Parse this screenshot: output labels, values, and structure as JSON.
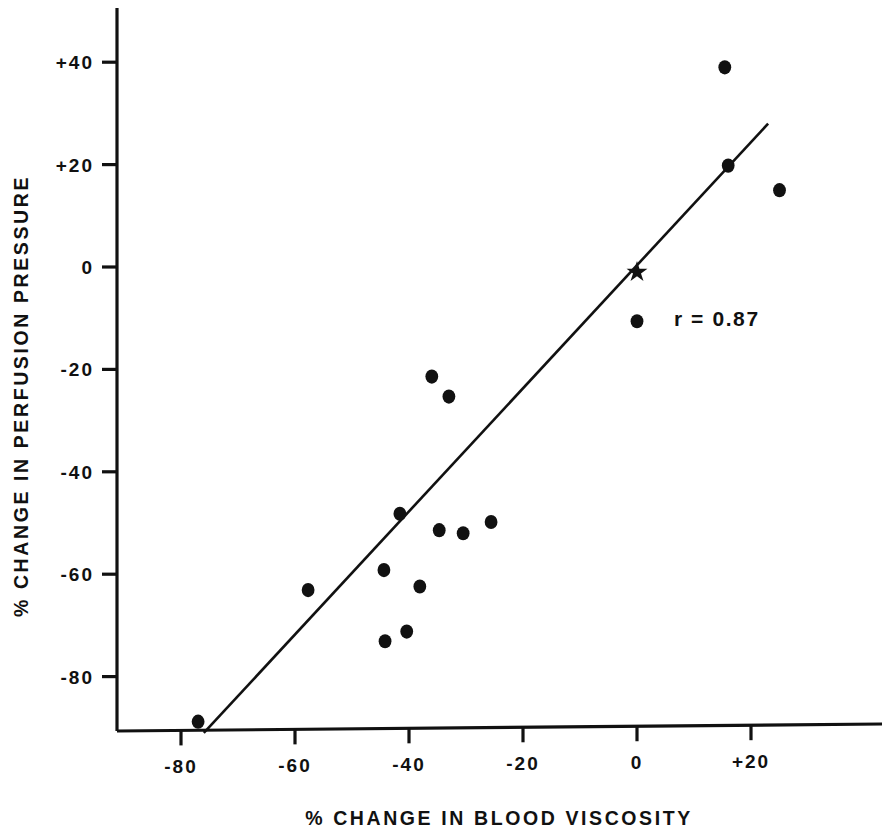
{
  "chart_data": {
    "type": "scatter",
    "title": "",
    "xlabel": "% CHANGE IN BLOOD VISCOSITY",
    "ylabel": "% CHANGE IN PERFUSION PRESSURE",
    "xlim": [
      -88,
      34
    ],
    "ylim": [
      -92,
      48
    ],
    "xticks": [
      -80,
      -60,
      -40,
      -20,
      0,
      20
    ],
    "xtick_labels": [
      "-80",
      "-60",
      "-40",
      "-20",
      "0",
      "+20"
    ],
    "yticks": [
      -80,
      -60,
      -40,
      -20,
      0,
      20,
      40
    ],
    "ytick_labels": [
      "-80",
      "-60",
      "-40",
      "-20",
      "0",
      "+20",
      "+40"
    ],
    "grid": false,
    "legend": null,
    "marker": "filled-circle",
    "marker_color": "#111111",
    "line_color": "#111111",
    "points": [
      {
        "x": -77.0,
        "y": -88.8,
        "marker": "circle"
      },
      {
        "x": -57.7,
        "y": -63.1,
        "marker": "circle"
      },
      {
        "x": -44.4,
        "y": -59.2,
        "marker": "circle"
      },
      {
        "x": -44.2,
        "y": -73.1,
        "marker": "circle"
      },
      {
        "x": -41.6,
        "y": -48.2,
        "marker": "circle"
      },
      {
        "x": -40.4,
        "y": -71.2,
        "marker": "circle"
      },
      {
        "x": -38.1,
        "y": -62.4,
        "marker": "circle"
      },
      {
        "x": -36.0,
        "y": -21.4,
        "marker": "circle"
      },
      {
        "x": -34.7,
        "y": -51.4,
        "marker": "circle"
      },
      {
        "x": -33.0,
        "y": -25.3,
        "marker": "circle"
      },
      {
        "x": -30.5,
        "y": -52.0,
        "marker": "circle"
      },
      {
        "x": -25.6,
        "y": -49.8,
        "marker": "circle"
      },
      {
        "x": 0.0,
        "y": -10.6,
        "marker": "circle"
      },
      {
        "x": 0.0,
        "y": -1.0,
        "marker": "star"
      },
      {
        "x": 15.4,
        "y": 39.0,
        "marker": "circle"
      },
      {
        "x": 16.0,
        "y": 19.8,
        "marker": "circle"
      },
      {
        "x": 25.0,
        "y": 15.0,
        "marker": "circle"
      }
    ],
    "regression_line": {
      "x_start": -76.0,
      "y_start": -91.0,
      "x_end": 23.0,
      "y_end": 28.0,
      "correlation": 0.87
    },
    "annotations": [
      {
        "text": "r = 0.87",
        "x": 14.0,
        "y": -11.5
      }
    ]
  }
}
